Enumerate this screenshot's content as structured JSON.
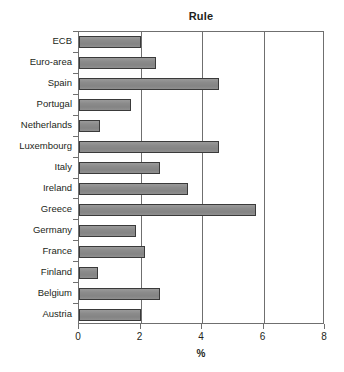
{
  "chart_data": {
    "type": "bar",
    "orientation": "horizontal",
    "title": "Rule",
    "xlabel": "%",
    "ylabel": "",
    "xlim": [
      0,
      8
    ],
    "xticks": [
      0,
      2,
      4,
      6,
      8
    ],
    "xtick_labels": [
      "0",
      "2",
      "4",
      "6",
      "8"
    ],
    "grid": "vertical gridlines at x = 2, 4, 6",
    "legend": null,
    "categories": [
      "ECB",
      "Euro-area",
      "Spain",
      "Portugal",
      "Netherlands",
      "Luxembourg",
      "Italy",
      "Ireland",
      "Greece",
      "Germany",
      "France",
      "Finland",
      "Belgium",
      "Austria"
    ],
    "values": [
      2.0,
      2.5,
      4.55,
      1.7,
      0.68,
      4.55,
      2.65,
      3.55,
      5.75,
      1.85,
      2.15,
      0.62,
      2.65,
      2.0
    ],
    "bar_fill_color": "#8e8e8e",
    "bar_edge_color": "#3a3a3a",
    "axis_color": "#6f6f6f"
  }
}
